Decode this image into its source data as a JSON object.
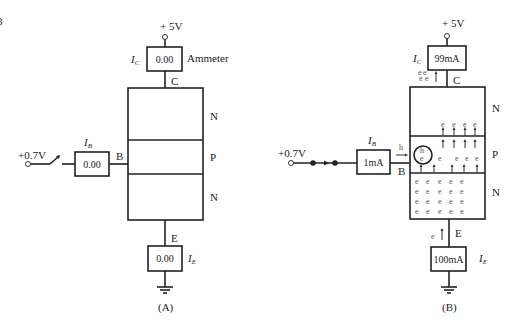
{
  "figure_marker": "3",
  "circuit_a": {
    "caption": "(A)",
    "supply_label": "+ 5V",
    "collector_meter": {
      "current_label": "I",
      "current_sub": "C",
      "reading": "0.00",
      "device_label": "Ammeter"
    },
    "collector_terminal": "C",
    "base_supply": "+0.7V",
    "switch_state": "open",
    "base_meter": {
      "current_label": "I",
      "current_sub": "B",
      "reading": "0.00"
    },
    "base_terminal": "B",
    "layers": [
      "N",
      "P",
      "N"
    ],
    "emitter_terminal": "E",
    "emitter_meter": {
      "current_label": "I",
      "current_sub": "E",
      "reading": "0.00"
    }
  },
  "circuit_b": {
    "caption": "(B)",
    "supply_label": "+ 5V",
    "collector_meter": {
      "current_label": "I",
      "current_sub": "C",
      "reading": "99mA"
    },
    "collector_terminal": "C",
    "base_supply": "+0.7V",
    "switch_state": "closed",
    "base_meter": {
      "current_label": "I",
      "current_sub": "B",
      "reading": "1mA"
    },
    "base_terminal": "B",
    "hole_label": "h",
    "electron_label": "e",
    "recombination_label": {
      "hole": "h",
      "electron": "e"
    },
    "layers": [
      "N",
      "P",
      "N"
    ],
    "emitter_terminal": "E",
    "emitter_meter": {
      "current_label": "I",
      "current_sub": "E",
      "reading": "100mA"
    }
  }
}
